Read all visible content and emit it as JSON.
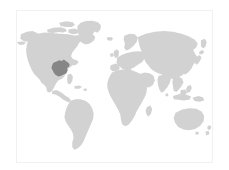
{
  "map": {
    "title": "World Map",
    "description": "Grey world map locator with one highlighted region",
    "projection": "equirectangular",
    "frame": {
      "border_color": "#f1f1f1",
      "background_color": "#ffffff"
    },
    "colors": {
      "ocean": "#ffffff",
      "land": "#d2d2d2",
      "highlight": "#868686",
      "page_background": "#ffffff"
    },
    "landmasses": [
      {
        "name": "north-america",
        "label": "North America"
      },
      {
        "name": "greenland",
        "label": "Greenland"
      },
      {
        "name": "central-america",
        "label": "Central America"
      },
      {
        "name": "south-america",
        "label": "South America"
      },
      {
        "name": "europe",
        "label": "Europe"
      },
      {
        "name": "africa",
        "label": "Africa"
      },
      {
        "name": "asia",
        "label": "Asia"
      },
      {
        "name": "india",
        "label": "India"
      },
      {
        "name": "southeast-asia",
        "label": "Southeast Asia"
      },
      {
        "name": "japan",
        "label": "Japan"
      },
      {
        "name": "indonesia",
        "label": "Indonesia"
      },
      {
        "name": "australia",
        "label": "Australia"
      },
      {
        "name": "new-zealand",
        "label": "New Zealand"
      },
      {
        "name": "madagascar",
        "label": "Madagascar"
      },
      {
        "name": "british-isles",
        "label": "British Isles"
      },
      {
        "name": "iceland",
        "label": "Iceland"
      },
      {
        "name": "caribbean",
        "label": "Caribbean Islands"
      },
      {
        "name": "philippines",
        "label": "Philippines"
      },
      {
        "name": "sri-lanka",
        "label": "Sri Lanka"
      }
    ],
    "highlight": {
      "name": "highlighted-region",
      "label": "Central United States",
      "continent": "North America",
      "color": "#868686"
    }
  }
}
